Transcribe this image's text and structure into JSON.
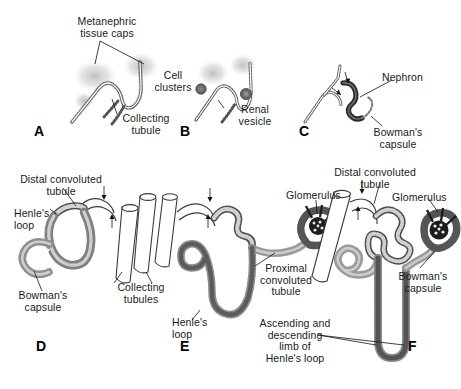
{
  "figure": {
    "background_color": "#ffffff",
    "text_color": "#1a1a1a",
    "tubule_fill": "#9b9b9b",
    "tubule_dark": "#4a4a4a",
    "tubule_light": "#ffffff",
    "cap_tissue_color": "#c9c9c9",
    "vesicle_color": "#6e6e6e"
  },
  "panels": [
    {
      "letter": "A",
      "labels": [
        {
          "key": "metanephric_caps",
          "text": "Metanephric\ntissue caps"
        },
        {
          "key": "collecting_tubule",
          "text": "Collecting\ntubule"
        }
      ]
    },
    {
      "letter": "B",
      "labels": [
        {
          "key": "cell_clusters",
          "text": "Cell\nclusters"
        },
        {
          "key": "renal_vesicle",
          "text": "Renal\nvesicle"
        }
      ]
    },
    {
      "letter": "C",
      "labels": [
        {
          "key": "nephron",
          "text": "Nephron"
        },
        {
          "key": "bowmans_capsule",
          "text": "Bowman's\ncapsule"
        }
      ]
    },
    {
      "letter": "D",
      "labels": [
        {
          "key": "distal_convoluted_tubule",
          "text": "Distal convoluted\ntubule"
        },
        {
          "key": "henles_loop",
          "text": "Henle's\nloop"
        },
        {
          "key": "bowmans_capsule",
          "text": "Bowman's\ncapsule"
        },
        {
          "key": "collecting_tubules",
          "text": "Collecting\ntubules"
        }
      ]
    },
    {
      "letter": "E",
      "labels": [
        {
          "key": "glomerulus",
          "text": "Glomerulus"
        },
        {
          "key": "proximal_convoluted_tubule",
          "text": "Proximal\nconvoluted\ntubule"
        },
        {
          "key": "henles_loop",
          "text": "Henle's\nloop"
        }
      ]
    },
    {
      "letter": "F",
      "labels": [
        {
          "key": "distal_convoluted_tubule",
          "text": "Distal convoluted\ntubule"
        },
        {
          "key": "glomerulus",
          "text": "Glomerulus"
        },
        {
          "key": "bowmans_capsule",
          "text": "Bowman's\ncapsule"
        },
        {
          "key": "ascending_descending_limb",
          "text": "Ascending and\ndescending\nlimb of\nHenle's loop"
        }
      ]
    }
  ],
  "text": {
    "a_metanephric_caps": "Metanephric\ntissue caps",
    "a_collecting_tubule": "Collecting\ntubule",
    "a_letter": "A",
    "b_cell_clusters": "Cell\nclusters",
    "b_renal_vesicle": "Renal\nvesicle",
    "b_letter": "B",
    "c_nephron": "Nephron",
    "c_bowmans_capsule": "Bowman's\ncapsule",
    "c_letter": "C",
    "d_distal_convoluted_tubule": "Distal convoluted\ntubule",
    "d_henles_loop": "Henle's\nloop",
    "d_bowmans_capsule": "Bowman's\ncapsule",
    "d_collecting_tubules": "Collecting\ntubules",
    "d_letter": "D",
    "e_glomerulus": "Glomerulus",
    "e_proximal_convoluted_tubule": "Proximal\nconvoluted\ntubule",
    "e_henles_loop": "Henle's\nloop",
    "e_letter": "E",
    "f_distal_convoluted_tubule": "Distal convoluted\ntubule",
    "f_glomerulus": "Glomerulus",
    "f_bowmans_capsule": "Bowman's\ncapsule",
    "f_ascending_descending": "Ascending and\ndescending\nlimb of\nHenle's loop",
    "f_letter": "F"
  }
}
